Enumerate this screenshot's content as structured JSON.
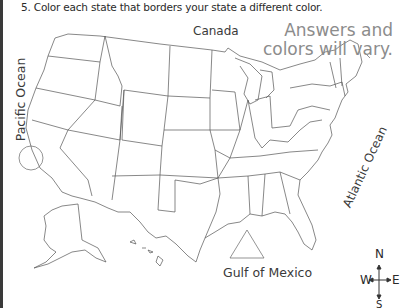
{
  "worksheet": {
    "question": "5. Color each state that borders your state a different color.",
    "answer_note_line1": "Answers and",
    "answer_note_line2": "colors will vary."
  },
  "map": {
    "labels": {
      "canada": "Canada",
      "pacific": "Pacific Ocean",
      "atlantic": "Atlantic Ocean",
      "gulf": "Gulf of Mexico"
    },
    "compass": {
      "north": "N",
      "south": "S",
      "east": "E",
      "west": "W"
    },
    "colors": {
      "outline": "#555555",
      "answer_text": "#8c8c8c",
      "label_text": "#3a3a3a"
    }
  }
}
